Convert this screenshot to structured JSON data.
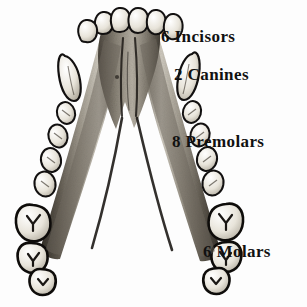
{
  "figure": {
    "background_color": "#fdfdfd",
    "ink_color": "#111111",
    "bone_light": "#d8d4cc",
    "bone_mid": "#8c867c",
    "bone_dark": "#3a352e",
    "tooth_fill": "#efece4"
  },
  "labels": {
    "incisors": "6 Incisors",
    "canines": "2 Canines",
    "premolars": "8 Premolars",
    "molars": "6 Molars"
  },
  "dentition": {
    "incisors_count": 6,
    "canines_count": 2,
    "premolars_count": 8,
    "molars_count": 6
  }
}
